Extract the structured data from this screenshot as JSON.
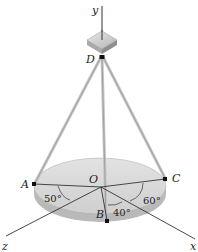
{
  "diagram": {
    "axes": {
      "x": "x",
      "y": "y",
      "z": "z"
    },
    "points": {
      "A": "A",
      "B": "B",
      "C": "C",
      "D": "D",
      "O": "O"
    },
    "angles": {
      "AOz": "50°",
      "xOB": "40°",
      "COx": "60°"
    },
    "colors": {
      "disk_top": "#dcdcdc",
      "disk_edge": "#b8b8b8",
      "cable": "#c9c9c9",
      "line": "#333333"
    }
  }
}
